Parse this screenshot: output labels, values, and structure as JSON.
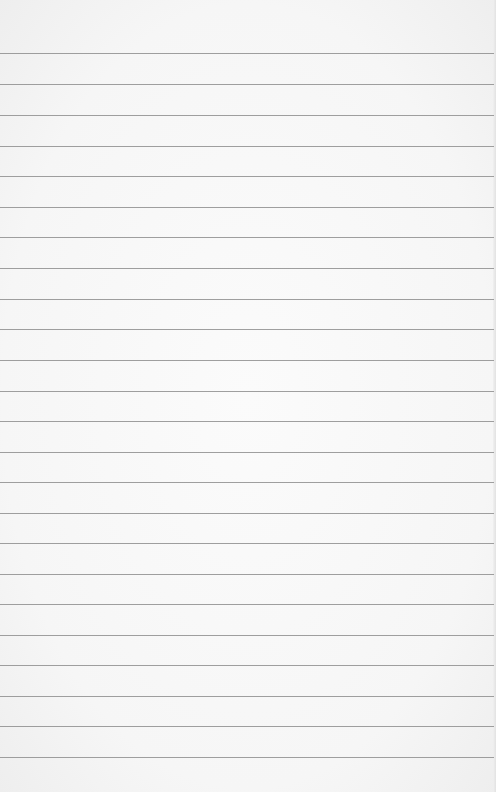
{
  "page": {
    "type": "blank-ruled-paper",
    "background_color": "#f7f7f7",
    "rule_color": "#8e8e8e",
    "rule_count": 24,
    "rule_positions_y": [
      53,
      84,
      115,
      146,
      176,
      207,
      237,
      268,
      299,
      329,
      360,
      391,
      421,
      452,
      482,
      513,
      543,
      574,
      604,
      635,
      665,
      696,
      726,
      757
    ]
  }
}
